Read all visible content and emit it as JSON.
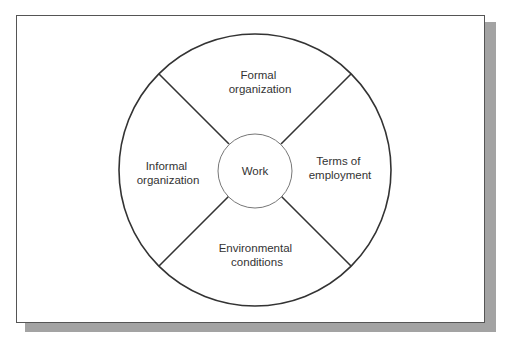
{
  "diagram": {
    "type": "segmented-circle",
    "center_label": "Work",
    "segments": [
      {
        "position": "top",
        "lines": [
          "Formal",
          "organization"
        ]
      },
      {
        "position": "right",
        "lines": [
          "Terms of",
          "employment"
        ]
      },
      {
        "position": "bottom",
        "lines": [
          "Environmental",
          "conditions"
        ]
      },
      {
        "position": "left",
        "lines": [
          "Informal",
          "organization"
        ]
      }
    ]
  },
  "colors": {
    "stroke": "#333333",
    "inner_stroke": "#777777",
    "shadow": "#a3a3a3",
    "frame_border": "#555555",
    "text": "#333333"
  },
  "caption": ""
}
